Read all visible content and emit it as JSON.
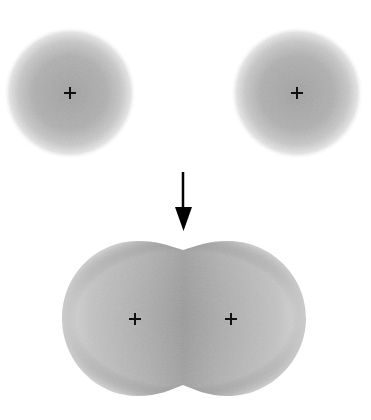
{
  "diagram": {
    "separated_atoms": [
      {
        "nucleus": {
          "x": 70,
          "y": 93
        },
        "radius": 64,
        "icon": "plus-icon"
      },
      {
        "nucleus": {
          "x": 297,
          "y": 93
        },
        "radius": 64,
        "icon": "plus-icon"
      }
    ],
    "arrow": {
      "x": 183,
      "y_start": 172,
      "y_end": 231,
      "direction": "down",
      "icon": "arrow-down-icon"
    },
    "merged_orbital": {
      "nuclei": [
        {
          "x": 135,
          "y": 319
        },
        {
          "x": 231,
          "y": 319
        }
      ],
      "bounds": {
        "left": 62,
        "right": 306,
        "top": 241,
        "bottom": 396
      },
      "center_dip_top": 250,
      "center_dip_bottom": 385
    },
    "colors": {
      "cloud_core": "#a4a4a4",
      "cloud_edge": "#e2e2e2",
      "nucleus_marker": "#111111",
      "arrow": "#000000",
      "background": "#ffffff"
    }
  }
}
